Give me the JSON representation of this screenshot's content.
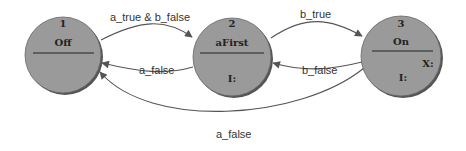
{
  "states": [
    {
      "id": "1",
      "name": "Off",
      "actions": []
    },
    {
      "id": "2",
      "name": "aFirst",
      "actions": [
        "I:"
      ]
    },
    {
      "id": "3",
      "name": "On",
      "actions": [
        "X:",
        "I:"
      ]
    }
  ],
  "transitions": [
    {
      "from": "1",
      "to": "2",
      "label": "a_true & b_false"
    },
    {
      "from": "2",
      "to": "1",
      "label": "a_false"
    },
    {
      "from": "2",
      "to": "3",
      "label": "b_true"
    },
    {
      "from": "3",
      "to": "2",
      "label": "b_false"
    },
    {
      "from": "3",
      "to": "1",
      "label": "a_false"
    }
  ],
  "colors": {
    "state_fill": "#9a9a9a",
    "state_shadow": "#555555",
    "edge": "#555555"
  }
}
